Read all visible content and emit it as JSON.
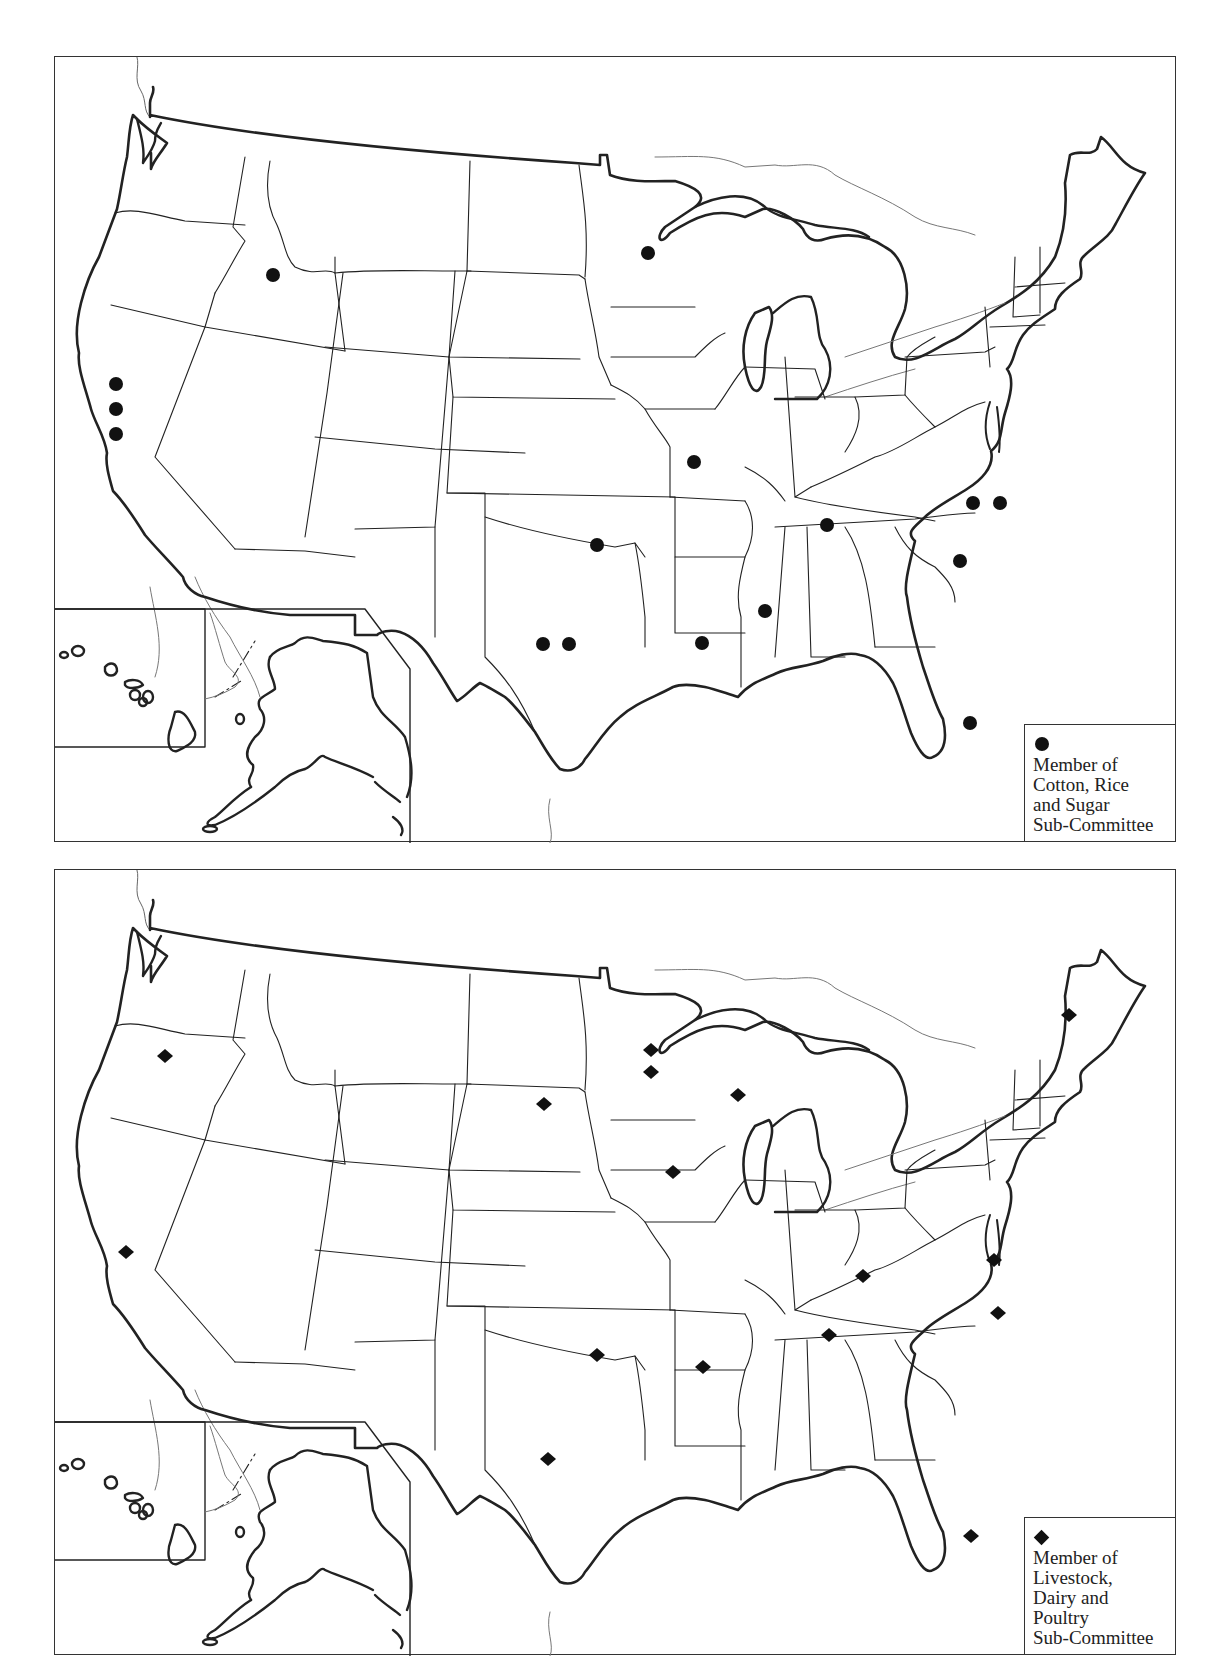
{
  "maps": [
    {
      "id": "cotton-rice-sugar",
      "legend": {
        "symbol": "filled-circle",
        "lines": [
          "Member of",
          "Cotton, Rice",
          "and Sugar",
          "Sub-Committee"
        ]
      },
      "markers": [
        {
          "state": "ID",
          "x": 272,
          "y": 274
        },
        {
          "state": "CA",
          "x": 115,
          "y": 383
        },
        {
          "state": "CA",
          "x": 115,
          "y": 408
        },
        {
          "state": "CA",
          "x": 115,
          "y": 433
        },
        {
          "state": "MN",
          "x": 647,
          "y": 252
        },
        {
          "state": "MO",
          "x": 693,
          "y": 461
        },
        {
          "state": "OK",
          "x": 596,
          "y": 544
        },
        {
          "state": "TX",
          "x": 542,
          "y": 643
        },
        {
          "state": "TX",
          "x": 568,
          "y": 643
        },
        {
          "state": "LA",
          "x": 701,
          "y": 642
        },
        {
          "state": "MS",
          "x": 764,
          "y": 610
        },
        {
          "state": "TN",
          "x": 826,
          "y": 524
        },
        {
          "state": "NC",
          "x": 972,
          "y": 502
        },
        {
          "state": "NC",
          "x": 999,
          "y": 502
        },
        {
          "state": "SC",
          "x": 959,
          "y": 560
        },
        {
          "state": "FL",
          "x": 969,
          "y": 722
        }
      ]
    },
    {
      "id": "livestock-dairy-poultry",
      "legend": {
        "symbol": "filled-diamond",
        "lines": [
          "Member of",
          "Livestock,",
          "Dairy and",
          "Poultry",
          "Sub-Committee"
        ]
      },
      "markers": [
        {
          "state": "OR",
          "x": 164,
          "y": 1055
        },
        {
          "state": "CA",
          "x": 125,
          "y": 1251
        },
        {
          "state": "SD",
          "x": 543,
          "y": 1103
        },
        {
          "state": "MN",
          "x": 650,
          "y": 1049
        },
        {
          "state": "MN",
          "x": 650,
          "y": 1071
        },
        {
          "state": "WI",
          "x": 737,
          "y": 1094
        },
        {
          "state": "IA",
          "x": 672,
          "y": 1171
        },
        {
          "state": "VT",
          "x": 1068,
          "y": 1014
        },
        {
          "state": "KY",
          "x": 862,
          "y": 1275
        },
        {
          "state": "VA",
          "x": 993,
          "y": 1259
        },
        {
          "state": "NC",
          "x": 997,
          "y": 1312
        },
        {
          "state": "TN",
          "x": 828,
          "y": 1334
        },
        {
          "state": "OK",
          "x": 596,
          "y": 1354
        },
        {
          "state": "AR",
          "x": 702,
          "y": 1366
        },
        {
          "state": "TX",
          "x": 547,
          "y": 1458
        },
        {
          "state": "FL",
          "x": 970,
          "y": 1535
        }
      ]
    }
  ]
}
